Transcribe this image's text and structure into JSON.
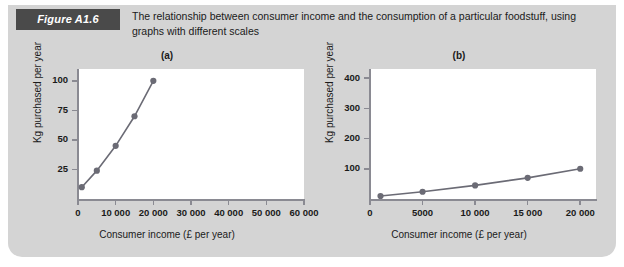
{
  "figure": {
    "badge_label": "Figure A1.6",
    "caption": "The relationship between consumer income and the consumption of a particular foodstuff, using graphs with different scales",
    "background_color": "#d4d4d4",
    "badge_color": "#4a4a4a",
    "series_color": "#6b6b75"
  },
  "chart_data": [
    {
      "type": "line",
      "title": "(a)",
      "xlabel": "Consumer income (£ per year)",
      "ylabel": "Kg purchased per year",
      "xlim": [
        0,
        60000
      ],
      "ylim": [
        0,
        110
      ],
      "grid": false,
      "legend": "none",
      "xticks": [
        0,
        10000,
        20000,
        30000,
        40000,
        50000,
        60000
      ],
      "xticklabels": [
        "0",
        "10 000",
        "20 000",
        "30 000",
        "40 000",
        "50 000",
        "60 000"
      ],
      "yticks": [
        25,
        50,
        75,
        100
      ],
      "yticklabels": [
        "25",
        "50",
        "75",
        "100"
      ],
      "x": [
        1000,
        5000,
        10000,
        15000,
        20000
      ],
      "y": [
        10,
        24,
        45,
        70,
        100
      ],
      "markers": true
    },
    {
      "type": "line",
      "title": "(b)",
      "xlabel": "Consumer income (£ per year)",
      "ylabel": "Kg purchased per year",
      "xlim": [
        0,
        21500
      ],
      "ylim": [
        0,
        430
      ],
      "grid": false,
      "legend": "none",
      "xticks": [
        0,
        5000,
        10000,
        15000,
        20000
      ],
      "xticklabels": [
        "0",
        "5000",
        "10 000",
        "15 000",
        "20 000"
      ],
      "yticks": [
        100,
        200,
        300,
        400
      ],
      "yticklabels": [
        "100",
        "200",
        "300",
        "400"
      ],
      "x": [
        1000,
        5000,
        10000,
        15000,
        20000
      ],
      "y": [
        10,
        24,
        45,
        70,
        100
      ],
      "markers": true
    }
  ]
}
